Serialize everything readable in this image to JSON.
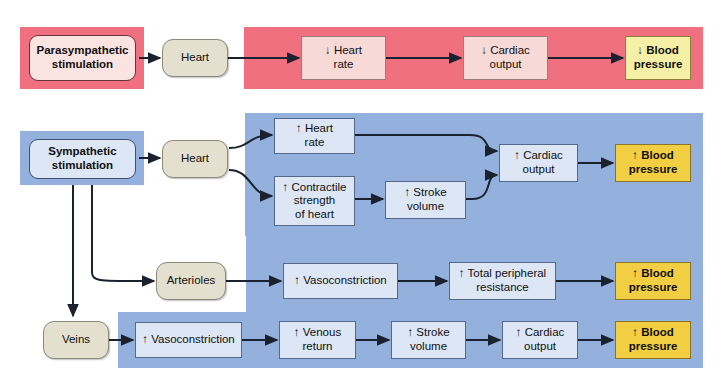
{
  "diagram": {
    "colors": {
      "parasympathetic_panel": "#F0707F",
      "sympathetic_panel": "#94B0DD",
      "organ_box": "#E3E0D0",
      "effect_box_para": "#F7D9D6",
      "effect_box_symp": "#DCE6F5",
      "outcome_para": "#F6F0A6",
      "outcome_symp": "#F2CE43",
      "line": "#1A2230"
    },
    "arrows": {
      "up": "↑",
      "down": "↓"
    }
  },
  "parasympathetic": {
    "source": "Parasympathetic stimulation",
    "source_line1": "Parasympathetic",
    "source_line2": "stimulation",
    "organ": "Heart",
    "steps": [
      {
        "arrow": "↓",
        "line1": "Heart",
        "line2": "rate"
      },
      {
        "arrow": "↓",
        "line1": "Cardiac",
        "line2": "output"
      }
    ],
    "outcome": {
      "arrow": "↓",
      "line1": "Blood",
      "line2": "pressure"
    }
  },
  "sympathetic": {
    "source": "Sympathetic stimulation",
    "source_line1": "Sympathetic",
    "source_line2": "stimulation",
    "organs": {
      "heart": "Heart",
      "arterioles": "Arterioles",
      "veins": "Veins"
    },
    "heart_branch": {
      "heart_rate": {
        "arrow": "↑",
        "line1": "Heart",
        "line2": "rate"
      },
      "contractile": {
        "arrow": "↑",
        "line1": "Contractile",
        "line2": "strength",
        "line3": "of heart"
      },
      "stroke_volume": {
        "arrow": "↑",
        "line1": "Stroke",
        "line2": "volume"
      },
      "cardiac_output": {
        "arrow": "↑",
        "line1": "Cardiac",
        "line2": "output"
      },
      "outcome": {
        "arrow": "↑",
        "line1": "Blood",
        "line2": "pressure"
      }
    },
    "arteriole_branch": {
      "vasoconstriction": {
        "arrow": "↑",
        "line1": "Vasoconstriction"
      },
      "resistance": {
        "arrow": "↑",
        "line1": "Total peripheral",
        "line2": "resistance"
      },
      "outcome": {
        "arrow": "↑",
        "line1": "Blood",
        "line2": "pressure"
      }
    },
    "vein_branch": {
      "vasoconstriction": {
        "arrow": "↑",
        "line1": "Vasoconstriction"
      },
      "venous_return": {
        "arrow": "↑",
        "line1": "Venous",
        "line2": "return"
      },
      "stroke_volume": {
        "arrow": "↑",
        "line1": "Stroke",
        "line2": "volume"
      },
      "cardiac_output": {
        "arrow": "↑",
        "line1": "Cardiac",
        "line2": "output"
      },
      "outcome": {
        "arrow": "↑",
        "line1": "Blood",
        "line2": "pressure"
      }
    }
  }
}
